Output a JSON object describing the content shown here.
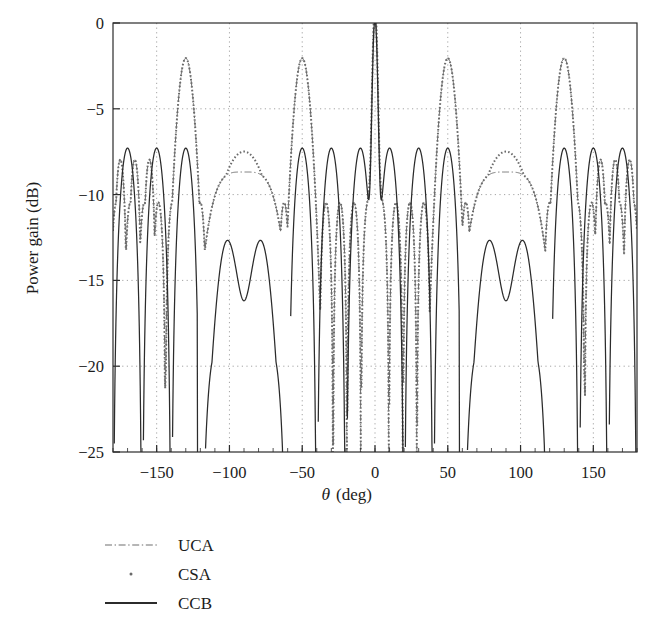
{
  "chart_data": {
    "type": "line",
    "title": "",
    "subtitle": "",
    "xlabel": "θ (deg)",
    "xlabel_parts": {
      "symbol": "θ",
      "unit": "(deg)"
    },
    "ylabel": "Power gain (dB)",
    "xlim": [
      -180,
      180
    ],
    "ylim": [
      -25,
      0
    ],
    "xticks": [
      -150,
      -100,
      -50,
      0,
      50,
      100,
      150
    ],
    "xtick_labels": [
      "−150",
      "−100",
      "−50",
      "0",
      "50",
      "100",
      "150"
    ],
    "yticks": [
      0,
      -5,
      -10,
      -15,
      -20,
      -25
    ],
    "ytick_labels": [
      "0",
      "−5",
      "−10",
      "−15",
      "−20",
      "−25"
    ],
    "grid": true,
    "grid_style": "dotted",
    "grid_color": "#9a9a9a",
    "frame": true,
    "legend_position": "below-left",
    "legend": [
      {
        "name": "UCA",
        "style": "dash-dot",
        "color": "#6e6e6e",
        "width": 1.1
      },
      {
        "name": "CSA",
        "style": "dotted",
        "color": "#6a6a6a",
        "width": 1.4
      },
      {
        "name": "CCB",
        "style": "solid",
        "color": "#2b2b2b",
        "width": 1.3
      }
    ],
    "series": [
      {
        "name": "UCA",
        "style": "dash-dot",
        "model": "uca",
        "description": "Uniform circular array beampattern: narrow mainlobe at 0 deg reaching 0 dB, broad raised shoulders near +/-130 deg peaking near -2 dB, flat plateau near -8.7 dB around +/-90 deg, deep nulls below -25 dB",
        "mainlobe_peak_db": 0,
        "mainlobe_center_deg": 0,
        "shoulder_peaks_deg": [
          -130,
          130
        ],
        "shoulder_peak_db": -2.0,
        "plateau_db": -8.7,
        "plateau_centers_deg": [
          -90,
          90
        ],
        "floor_db": -25
      },
      {
        "name": "CSA",
        "style": "dotted",
        "model": "csa",
        "description": "Concentric/sparse array beampattern: follows UCA closely, thick dotted trace, domed cap peaking near -7.5 dB at +/-90 deg and near -2 dB at +/-130 deg",
        "mainlobe_peak_db": 0,
        "dome_peak_db": -7.5,
        "dome_centers_deg": [
          -90,
          90
        ],
        "shoulder_peaks_deg": [
          -130,
          130
        ],
        "shoulder_peak_db": -2.0,
        "floor_db": -25
      },
      {
        "name": "CCB",
        "style": "solid",
        "model": "ccb",
        "description": "Constrained/conventional beamformer: narrow 0 dB mainlobe at 0 deg, regular sidelobes near -7.3 dB, twin humps near -12.5 dB centered about +/-75 and +/-105 deg with a -14 dB saddle at +/-90 deg, nulls reaching below -25 dB",
        "mainlobe_peak_db": 0,
        "sidelobe_peak_db": -7.3,
        "hump_peak_db": -12.5,
        "saddle_db": -14.0,
        "saddle_centers_deg": [
          -90,
          90
        ],
        "null_floor_db": -25
      }
    ],
    "notes": [
      "Mainlobe of all three curves reaches 0 dB exactly at theta = 0 deg.",
      "Pattern is symmetric about theta = 0 deg.",
      "Plot is clipped at -25 dB; nulls extend below the axis limit."
    ],
    "sampled_points": {
      "deg": [
        -180,
        -170,
        -160,
        -150,
        -140,
        -130,
        -120,
        -110,
        -100,
        -90,
        -80,
        -70,
        -60,
        -50,
        -40,
        -30,
        -20,
        -10,
        0,
        10,
        20,
        30,
        40,
        50,
        60,
        70,
        80,
        90,
        100,
        110,
        120,
        130,
        140,
        150,
        160,
        170,
        180
      ],
      "UCA": [
        -0.2,
        -7.3,
        -10.5,
        -7.3,
        -9.0,
        -2.0,
        -9.2,
        -10.0,
        -8.9,
        -8.7,
        -8.9,
        -10.0,
        -9.2,
        -2.0,
        -9.0,
        -7.3,
        -10.5,
        -7.3,
        0.0,
        -7.3,
        -10.5,
        -7.3,
        -9.0,
        -2.0,
        -9.2,
        -10.0,
        -8.9,
        -8.7,
        -8.9,
        -10.0,
        -9.2,
        -2.0,
        -9.0,
        -7.3,
        -10.5,
        -7.3,
        -0.2
      ],
      "CSA": [
        -0.2,
        -7.3,
        -10.5,
        -7.3,
        -9.0,
        -2.0,
        -9.2,
        -10.0,
        -8.3,
        -7.5,
        -8.3,
        -10.0,
        -9.2,
        -2.0,
        -9.0,
        -7.3,
        -10.5,
        -7.3,
        0.0,
        -7.3,
        -10.5,
        -7.3,
        -9.0,
        -2.0,
        -9.2,
        -10.0,
        -8.3,
        -7.5,
        -8.3,
        -10.0,
        -9.2,
        -2.0,
        -9.0,
        -7.3,
        -10.5,
        -7.3,
        -0.2
      ],
      "CCB": [
        -0.3,
        -7.3,
        -16.0,
        -7.3,
        -16.0,
        -7.3,
        -16.0,
        -7.3,
        -13.0,
        -14.0,
        -13.0,
        -7.3,
        -16.0,
        -7.3,
        -16.0,
        -7.3,
        -16.0,
        -7.3,
        0.0,
        -7.3,
        -16.0,
        -7.3,
        -16.0,
        -7.3,
        -16.0,
        -7.3,
        -13.0,
        -14.0,
        -13.0,
        -7.3,
        -16.0,
        -7.3,
        -16.0,
        -7.3,
        -16.0,
        -7.3,
        -0.3
      ]
    }
  },
  "figure": {
    "background": "#ffffff",
    "axis_color": "#2b2b2b",
    "text_color": "#1b1b1b"
  }
}
